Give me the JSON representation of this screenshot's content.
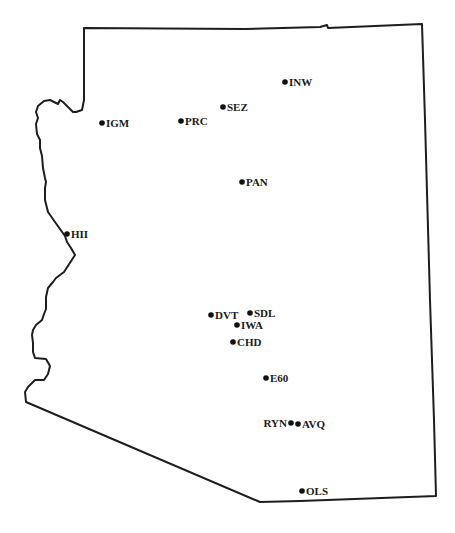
{
  "map": {
    "title": "Arizona station locations",
    "colors": {
      "border": "#1e1e1e",
      "marker": "#111111",
      "label": "#1a1a1a",
      "background": "#ffffff"
    },
    "stations": [
      {
        "id": "INW",
        "label": "INW",
        "x": 285,
        "y": 82,
        "label_side": "right"
      },
      {
        "id": "SEZ",
        "label": "SEZ",
        "x": 223,
        "y": 107,
        "label_side": "right"
      },
      {
        "id": "IGM",
        "label": "IGM",
        "x": 102,
        "y": 123,
        "label_side": "right"
      },
      {
        "id": "PRC",
        "label": "PRC",
        "x": 181,
        "y": 121,
        "label_side": "right"
      },
      {
        "id": "PAN",
        "label": "PAN",
        "x": 242,
        "y": 182,
        "label_side": "right"
      },
      {
        "id": "HII",
        "label": "HII",
        "x": 67,
        "y": 234,
        "label_side": "right"
      },
      {
        "id": "DVT",
        "label": "DVT",
        "x": 211,
        "y": 315,
        "label_side": "right"
      },
      {
        "id": "SDL",
        "label": "SDL",
        "x": 250,
        "y": 313,
        "label_side": "right"
      },
      {
        "id": "IWA",
        "label": "IWA",
        "x": 237,
        "y": 325,
        "label_side": "right"
      },
      {
        "id": "CHD",
        "label": "CHD",
        "x": 233,
        "y": 342,
        "label_side": "right"
      },
      {
        "id": "E60",
        "label": "E60",
        "x": 266,
        "y": 378,
        "label_side": "right"
      },
      {
        "id": "RYN",
        "label": "RYN",
        "x": 291,
        "y": 423,
        "label_side": "left"
      },
      {
        "id": "AVQ",
        "label": "AVQ",
        "x": 298,
        "y": 424,
        "label_side": "right"
      },
      {
        "id": "OLS",
        "label": "OLS",
        "x": 302,
        "y": 491,
        "label_side": "right"
      }
    ]
  }
}
